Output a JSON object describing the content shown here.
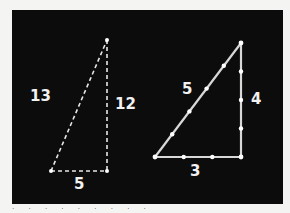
{
  "figure": {
    "background_color": "#0c0c0c",
    "line_color": "#e8e8e8",
    "triangles": [
      {
        "name": "5-12-13 triangle",
        "sides": {
          "hypotenuse": "13",
          "vertical": "12",
          "base": "5"
        },
        "vertices": [
          [
            51,
            171
          ],
          [
            107,
            171
          ],
          [
            107,
            40
          ]
        ]
      },
      {
        "name": "3-4-5 triangle",
        "sides": {
          "hypotenuse": "5",
          "vertical": "4",
          "base": "3"
        },
        "vertices": [
          [
            155,
            157
          ],
          [
            241,
            157
          ],
          [
            241,
            43
          ]
        ]
      }
    ]
  },
  "caption": "· · · · · · · · ·"
}
